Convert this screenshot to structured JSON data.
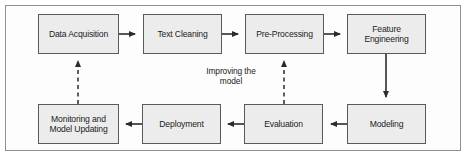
{
  "diagram": {
    "frame": {
      "border_color": "#8f8f8f",
      "background": "#fdfdfd"
    },
    "node_style": {
      "fill": "#ececec",
      "stroke": "#5a5a5a",
      "text_color": "#1c1c1c"
    },
    "arrow_style": {
      "solid_color": "#2b2b2b",
      "dashed_color": "#2b2b2b"
    },
    "nodes": [
      {
        "id": "data-acquisition",
        "label": "Data Acquisition",
        "x": 38,
        "y": 14,
        "w": 81,
        "h": 40
      },
      {
        "id": "text-cleaning",
        "label": "Text Cleaning",
        "x": 143,
        "y": 14,
        "w": 79,
        "h": 40
      },
      {
        "id": "pre-processing",
        "label": "Pre-Processing",
        "x": 245,
        "y": 14,
        "w": 79,
        "h": 40
      },
      {
        "id": "feature-engineering",
        "label": "Feature\nEngineering",
        "x": 347,
        "y": 14,
        "w": 79,
        "h": 40
      },
      {
        "id": "monitoring-updating",
        "label": "Monitoring and\nModel Updating",
        "x": 38,
        "y": 104,
        "w": 81,
        "h": 40
      },
      {
        "id": "deployment",
        "label": "Deployment",
        "x": 142,
        "y": 104,
        "w": 79,
        "h": 40
      },
      {
        "id": "evaluation",
        "label": "Evaluation",
        "x": 244,
        "y": 104,
        "w": 79,
        "h": 40
      },
      {
        "id": "modeling",
        "label": "Modeling",
        "x": 347,
        "y": 104,
        "w": 79,
        "h": 40
      }
    ],
    "edges": [
      {
        "id": "data-acquisition-to-text-cleaning",
        "from": "data-acquisition",
        "to": "text-cleaning",
        "style": "solid",
        "direction": "right"
      },
      {
        "id": "text-cleaning-to-pre-processing",
        "from": "text-cleaning",
        "to": "pre-processing",
        "style": "solid",
        "direction": "right"
      },
      {
        "id": "pre-processing-to-feature-engineering",
        "from": "pre-processing",
        "to": "feature-engineering",
        "style": "solid",
        "direction": "right"
      },
      {
        "id": "feature-engineering-to-modeling",
        "from": "feature-engineering",
        "to": "modeling",
        "style": "solid",
        "direction": "down"
      },
      {
        "id": "modeling-to-evaluation",
        "from": "modeling",
        "to": "evaluation",
        "style": "solid",
        "direction": "left"
      },
      {
        "id": "evaluation-to-deployment",
        "from": "evaluation",
        "to": "deployment",
        "style": "solid",
        "direction": "left"
      },
      {
        "id": "deployment-to-monitoring",
        "from": "deployment",
        "to": "monitoring-updating",
        "style": "solid",
        "direction": "left"
      },
      {
        "id": "evaluation-to-pre-processing-feedback",
        "from": "evaluation",
        "to": "pre-processing",
        "style": "dashed",
        "direction": "up",
        "label": "Improving the\nmodel"
      },
      {
        "id": "monitoring-to-data-acquisition-feedback",
        "from": "monitoring-updating",
        "to": "data-acquisition",
        "style": "dashed",
        "direction": "up"
      }
    ],
    "edge_labels": [
      {
        "id": "improving-the-model-label",
        "text": "Improving the\nmodel",
        "x": 196,
        "y": 66,
        "w": 70
      }
    ]
  }
}
